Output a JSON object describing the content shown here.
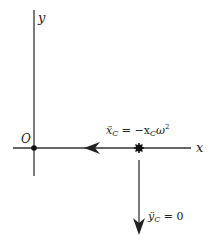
{
  "diagram": {
    "axes": {
      "y_label": "y",
      "x_label": "x",
      "origin_label": "O"
    },
    "annotations": {
      "x_accel": "ẍ",
      "x_accel_sub": "C",
      "x_accel_eq": " = −x",
      "x_accel_sub2": "C",
      "x_accel_omega": "ω",
      "x_accel_sup": "2",
      "y_accel": "ÿ",
      "y_accel_sub": "C",
      "y_accel_eq": " = 0"
    },
    "colors": {
      "line": "#222222",
      "background": "#ffffff"
    }
  }
}
